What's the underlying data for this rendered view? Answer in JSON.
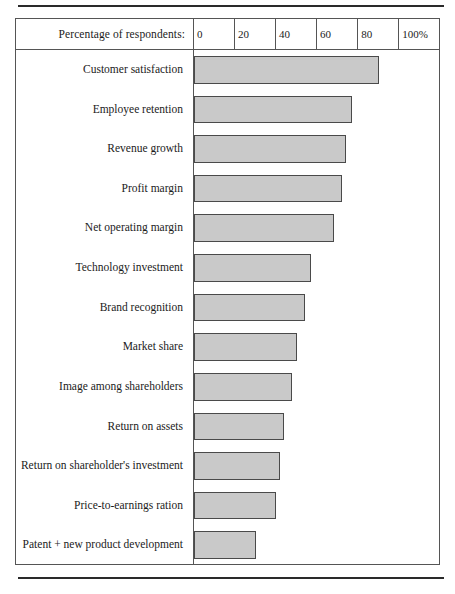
{
  "chart_data": {
    "type": "bar",
    "orientation": "horizontal",
    "title": "",
    "xlabel": "Percentage of respondents:",
    "ylabel": "",
    "xlim": [
      0,
      100
    ],
    "grid": false,
    "legend": null,
    "axis_header": "Percentage of respondents:",
    "tick_labels": [
      "0",
      "20",
      "40",
      "60",
      "80",
      "100%"
    ],
    "tick_values": [
      0,
      20,
      40,
      60,
      80,
      100
    ],
    "categories": [
      "Customer satisfaction",
      "Employee retention",
      "Revenue growth",
      "Profit margin",
      "Net operating margin",
      "Technology investment",
      "Brand recognition",
      "Market share",
      "Image among shareholders",
      "Return on assets",
      "Return on shareholder's investment",
      "Price-to-earnings ration",
      "Patent + new product development"
    ],
    "values": [
      90,
      77,
      74,
      72,
      68,
      57,
      54,
      50,
      48,
      44,
      42,
      40,
      30
    ]
  },
  "axis": {
    "header_label": "Percentage of respondents:",
    "ticks": [
      {
        "label": "0",
        "value": 0
      },
      {
        "label": "20",
        "value": 20
      },
      {
        "label": "40",
        "value": 40
      },
      {
        "label": "60",
        "value": 60
      },
      {
        "label": "80",
        "value": 80
      },
      {
        "label": "100%",
        "value": 100
      }
    ]
  },
  "colors": {
    "bar_fill": "#c9c9c9",
    "bar_stroke": "#4a4a4a",
    "frame": "#555555",
    "rule": "#2a2a2a",
    "text": "#1b1b1b"
  }
}
